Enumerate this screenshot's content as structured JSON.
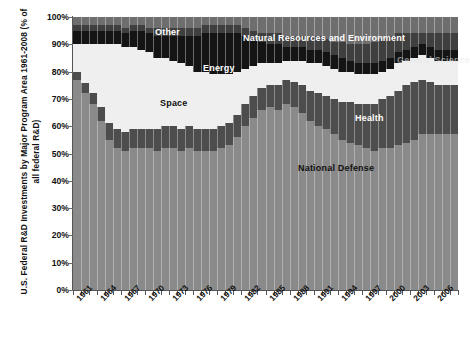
{
  "chart_data": {
    "type": "area",
    "title": "U.S. Federal R&D Investments by Major Program Area 1961-2008 (% of all federal R&D)",
    "ylabel": "U.S. Federal R&D Investments by Major Program Area 1961-2008 (% of all federal R&D)",
    "xlabel": "",
    "ylim": [
      0,
      100
    ],
    "ytick_labels": [
      "0%",
      "10%",
      "20%",
      "30%",
      "40%",
      "50%",
      "60%",
      "70%",
      "80%",
      "90%",
      "100%"
    ],
    "ytick_values": [
      0,
      10,
      20,
      30,
      40,
      50,
      60,
      70,
      80,
      90,
      100
    ],
    "grid": false,
    "legend_position": "in-plot annotations",
    "x": [
      1961,
      1962,
      1963,
      1964,
      1965,
      1966,
      1967,
      1968,
      1969,
      1970,
      1971,
      1972,
      1973,
      1974,
      1975,
      1976,
      1977,
      1978,
      1979,
      1980,
      1981,
      1982,
      1983,
      1984,
      1985,
      1986,
      1987,
      1988,
      1989,
      1990,
      1991,
      1992,
      1993,
      1994,
      1995,
      1996,
      1997,
      1998,
      1999,
      2000,
      2001,
      2002,
      2003,
      2004,
      2005,
      2006,
      2007,
      2008
    ],
    "xtick_labels": [
      "1961",
      "1964",
      "1967",
      "1970",
      "1973",
      "1976",
      "1979",
      "1982",
      "1985",
      "1988",
      "1991",
      "1994",
      "1997",
      "2000",
      "2003",
      "2006"
    ],
    "xtick_values": [
      1961,
      1964,
      1967,
      1970,
      1973,
      1976,
      1979,
      1982,
      1985,
      1988,
      1991,
      1994,
      1997,
      2000,
      2003,
      2006
    ],
    "stacked": true,
    "series": [
      {
        "name": "National Defense",
        "color": "#8a8a8a",
        "values": [
          77,
          72,
          68,
          62,
          55,
          52,
          51,
          52,
          52,
          52,
          51,
          52,
          52,
          51,
          52,
          51,
          51,
          51,
          52,
          53,
          56,
          60,
          63,
          66,
          67,
          66,
          68,
          67,
          65,
          62,
          60,
          59,
          57,
          55,
          54,
          53,
          52,
          51,
          52,
          52,
          53,
          54,
          55,
          57,
          57,
          57,
          57,
          57
        ]
      },
      {
        "name": "Health",
        "color": "#4d4d4d",
        "values": [
          3,
          4,
          4,
          5,
          6,
          7,
          7,
          7,
          7,
          7,
          8,
          8,
          8,
          8,
          8,
          8,
          8,
          8,
          8,
          8,
          8,
          8,
          8,
          8,
          8,
          9,
          9,
          9,
          10,
          11,
          12,
          12,
          13,
          14,
          15,
          15,
          16,
          17,
          18,
          19,
          20,
          21,
          21,
          20,
          19,
          18,
          18,
          18
        ]
      },
      {
        "name": "Space",
        "color": "#efefef",
        "values": [
          10,
          14,
          18,
          23,
          29,
          31,
          31,
          30,
          29,
          28,
          26,
          25,
          24,
          24,
          22,
          21,
          21,
          20,
          19,
          18,
          16,
          13,
          11,
          9,
          8,
          8,
          7,
          8,
          9,
          10,
          11,
          11,
          11,
          11,
          11,
          11,
          11,
          11,
          10,
          10,
          10,
          9,
          9,
          9,
          9,
          9,
          9,
          9
        ]
      },
      {
        "name": "Energy",
        "color": "#141414",
        "values": [
          5,
          5,
          5,
          5,
          5,
          5,
          5,
          6,
          7,
          7,
          8,
          8,
          9,
          10,
          11,
          13,
          14,
          15,
          15,
          15,
          14,
          12,
          10,
          8,
          7,
          7,
          5,
          5,
          5,
          5,
          5,
          5,
          5,
          5,
          4,
          4,
          4,
          4,
          4,
          4,
          4,
          4,
          4,
          4,
          4,
          4,
          4,
          4
        ]
      },
      {
        "name": "General Science",
        "color": "#3f3f3f",
        "values": [
          2,
          2,
          2,
          2,
          2,
          2,
          2,
          2,
          2,
          2,
          3,
          3,
          3,
          3,
          3,
          3,
          3,
          3,
          3,
          3,
          3,
          3,
          3,
          3,
          4,
          4,
          4,
          4,
          4,
          5,
          5,
          5,
          5,
          6,
          6,
          7,
          7,
          8,
          8,
          8,
          7,
          6,
          5,
          4,
          5,
          6,
          6,
          6
        ]
      },
      {
        "name": "Natural Resources and Environment",
        "color": "#6e6e6e",
        "values": [
          3,
          3,
          3,
          3,
          3,
          3,
          4,
          3,
          3,
          4,
          4,
          4,
          4,
          4,
          4,
          4,
          3,
          3,
          3,
          3,
          3,
          4,
          5,
          6,
          6,
          6,
          7,
          7,
          7,
          7,
          7,
          8,
          9,
          9,
          10,
          10,
          10,
          9,
          8,
          7,
          6,
          6,
          6,
          6,
          6,
          6,
          6,
          6
        ]
      }
    ],
    "annotations": [
      {
        "text": "Other",
        "series": "Other"
      },
      {
        "text": "Natural Resources and Environment",
        "series": "Natural Resources and Environment"
      },
      {
        "text": "Energy",
        "series": "Energy"
      },
      {
        "text": "Space",
        "series": "Space"
      },
      {
        "text": "Health",
        "series": "Health"
      },
      {
        "text": "National Defense",
        "series": "National Defense"
      },
      {
        "text": "General Science",
        "series": "General Science"
      }
    ]
  },
  "labels": {
    "other": "Other",
    "natural_resources": "Natural Resources and Environment",
    "energy": "Energy",
    "space": "Space",
    "health": "Health",
    "national_defense": "National Defense",
    "general_science": "General Science"
  },
  "colors": {
    "plot_background": "#7c7c7c",
    "national_defense": "#8a8a8a",
    "health": "#4d4d4d",
    "space": "#efefef",
    "energy": "#141414",
    "general_science": "#3f3f3f",
    "natural_resources": "#6e6e6e",
    "axis": "#555555",
    "text": "#111111"
  }
}
